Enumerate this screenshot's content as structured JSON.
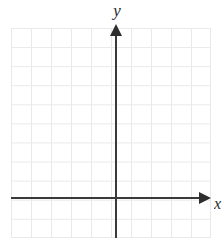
{
  "figure": {
    "kind": "cartesian-coordinate-plane",
    "background_color": "#ffffff",
    "grid_color": "#e9e9e9",
    "axis_color": "#3a3a3a",
    "label_color": "#2b2b2b"
  },
  "axes": {
    "y_label": "y",
    "x_label": "x",
    "y_arrow_direction": "up",
    "x_arrow_direction": "right"
  },
  "chart_data": {
    "type": "scatter",
    "title": "",
    "subtitle": "",
    "xlabel": "x",
    "ylabel": "y",
    "grid": true,
    "legend": "none",
    "annotations": [],
    "series": [
      {
        "name": "",
        "x": [],
        "y": []
      }
    ],
    "x": [],
    "categories": [],
    "values": [],
    "xlim": [
      -5.25,
      4.75
    ],
    "ylim": [
      -2,
      9
    ],
    "xticks": [
      -5,
      -4,
      -3,
      -2,
      -1,
      0,
      1,
      2,
      3,
      4
    ],
    "yticks": [
      -2,
      -1,
      0,
      1,
      2,
      3,
      4,
      5,
      6,
      7,
      8,
      9
    ],
    "xtick_labels": [],
    "ytick_labels": [],
    "grid_columns": 10,
    "grid_rows": 11,
    "cell_size_px": 20,
    "origin_px": {
      "x": 116,
      "y": 198
    }
  }
}
